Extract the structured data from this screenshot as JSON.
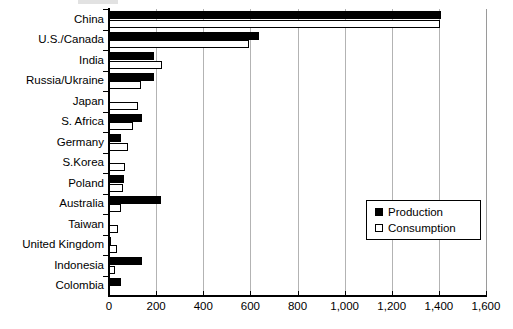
{
  "chart_data": {
    "type": "bar",
    "orientation": "horizontal",
    "title": "",
    "subtitle": "",
    "xlabel": "",
    "ylabel": "",
    "xlim": [
      0,
      1600
    ],
    "xticks": [
      0,
      200,
      400,
      600,
      800,
      1000,
      1200,
      1400,
      1600
    ],
    "xtick_labels": [
      "0",
      "200",
      "400",
      "600",
      "800",
      "1,000",
      "1,200",
      "1,400",
      "1,600"
    ],
    "grid": "vertical",
    "legend_position": "middle-right",
    "categories": [
      "China",
      "U.S./Canada",
      "India",
      "Russia/Ukraine",
      "Japan",
      "S. Africa",
      "Germany",
      "S.Korea",
      "Poland",
      "Australia",
      "Taiwan",
      "United Kingdom",
      "Indonesia",
      "Colombia"
    ],
    "series": [
      {
        "name": "Production",
        "color": "#000000",
        "values": [
          1410,
          635,
          190,
          190,
          0,
          140,
          50,
          0,
          65,
          220,
          0,
          8,
          140,
          50
        ]
      },
      {
        "name": "Consumption",
        "color": "#ffffff",
        "values": [
          1405,
          595,
          225,
          135,
          125,
          100,
          82,
          68,
          58,
          52,
          40,
          36,
          25,
          0
        ]
      }
    ]
  },
  "legend": {
    "items": [
      {
        "label": "Production",
        "marker": "filled-square-icon"
      },
      {
        "label": "Consumption",
        "marker": "open-square-icon"
      }
    ]
  }
}
